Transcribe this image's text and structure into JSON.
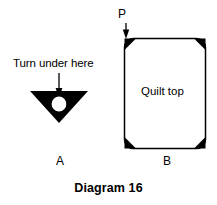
{
  "figure": {
    "caption": "Diagram 16",
    "background_color": "#ffffff",
    "ink_color": "#000000"
  },
  "panel_a": {
    "label": "A",
    "instruction_text": "Turn under here",
    "arrow": {
      "name": "down-arrow",
      "direction": "down"
    },
    "shape": {
      "name": "down-triangle",
      "fill": "#000000",
      "marker_letter": "P",
      "marker_circle_fill": "#ffffff"
    }
  },
  "panel_b": {
    "label": "B",
    "pointer_label": "P",
    "arrow": {
      "name": "down-arrow",
      "direction": "down"
    },
    "quilt": {
      "name": "quilt-rectangle",
      "center_text": "Quilt top",
      "fill": "#ffffff",
      "stroke": "#000000",
      "corner_piece_fill": "#000000",
      "corner_count": 4
    }
  }
}
